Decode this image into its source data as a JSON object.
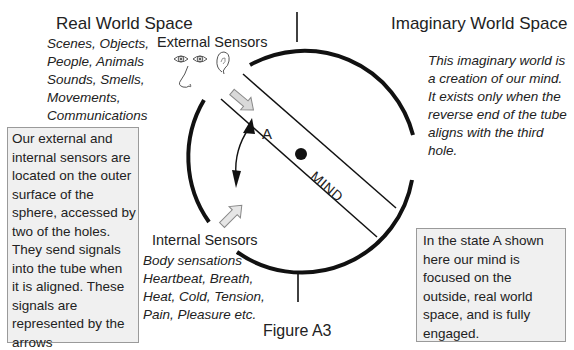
{
  "figure": {
    "caption": "Figure A3",
    "real_world": {
      "title": "Real World Space",
      "items": [
        "Scenes, Objects,",
        "People, Animals",
        "Sounds, Smells,",
        "Movements,",
        "Communications"
      ]
    },
    "imaginary_world": {
      "title": "Imaginary World Space",
      "description": [
        "This imaginary world is",
        "a creation of our mind.",
        "It exists only when the",
        "reverse end of the tube",
        "aligns with the third",
        "hole."
      ]
    },
    "external_sensors": {
      "label": "External Sensors",
      "icons": [
        "eye-icon",
        "eye-icon",
        "ear-icon",
        "nose-icon"
      ]
    },
    "internal_sensors": {
      "label": "Internal Sensors",
      "items": [
        "Body sensations",
        "Heartbeat, Breath,",
        "Heat, Cold, Tension,",
        "Pain, Pleasure etc."
      ]
    },
    "tube": {
      "label": "MIND",
      "state_label": "A"
    },
    "sensors_note": [
      "Our external and",
      "internal sensors are",
      "located on the outer",
      "surface of the",
      "sphere, accessed by",
      "two of the holes.",
      "They send signals",
      "into the tube when",
      "it is aligned. These",
      "signals are",
      "represented by the",
      "arrows"
    ],
    "state_note": [
      "In the state A shown",
      "here our mind is",
      "focused on the",
      "outside, real world",
      "space, and is fully",
      "engaged."
    ]
  }
}
